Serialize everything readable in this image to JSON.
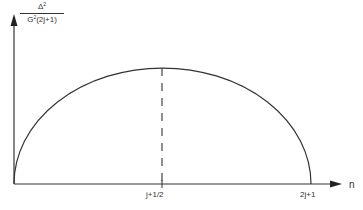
{
  "diagram": {
    "type": "semicircle-plot",
    "y_axis": {
      "label_numerator": "Δ",
      "label_numerator_sup": "2",
      "label_denominator_prefix": "G",
      "label_denominator_sup": "2",
      "label_denominator_suffix": "(2j+1)"
    },
    "x_axis": {
      "label": "n",
      "ticks": [
        "j+1/2",
        "2j+1"
      ]
    },
    "curve": {
      "shape": "semi-ellipse arc",
      "start": "0",
      "peak_at": "j+1/2",
      "end": "2j+1"
    },
    "dashed_line_at": "j+1/2",
    "colors": {
      "stroke": "#333333",
      "background": "#ffffff"
    }
  }
}
